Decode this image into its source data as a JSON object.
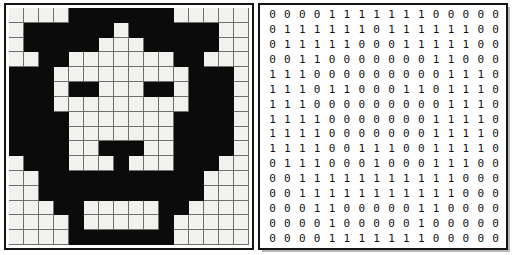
{
  "figure": {
    "panels": [
      {
        "name": "bitmap",
        "role": "rendered black and white pixel image of a face"
      },
      {
        "name": "matrix",
        "role": "binary digit matrix of the same image"
      }
    ],
    "grid_size": {
      "rows": 16,
      "cols": 16
    },
    "legend": {
      "one": "black pixel",
      "zero": "white pixel"
    },
    "colors": {
      "black": "#0b0b0b",
      "white": "#f1f1ee",
      "gridline": "#6f6f6f",
      "border": "#151515",
      "digit_text": "#111111",
      "background": "#ffffff"
    }
  },
  "chart_data": {
    "type": "heatmap",
    "title": "",
    "xlabel": "",
    "ylabel": "",
    "rows": 16,
    "cols": 16,
    "value_labels": {
      "0": "white",
      "1": "black"
    },
    "matrix": [
      [
        0,
        0,
        0,
        0,
        1,
        1,
        1,
        1,
        1,
        1,
        1,
        0,
        0,
        0,
        0,
        0
      ],
      [
        0,
        1,
        1,
        1,
        1,
        1,
        1,
        0,
        1,
        1,
        1,
        1,
        1,
        1,
        0,
        0
      ],
      [
        0,
        1,
        1,
        1,
        1,
        1,
        0,
        0,
        0,
        1,
        1,
        1,
        1,
        1,
        0,
        0
      ],
      [
        0,
        0,
        1,
        1,
        0,
        0,
        0,
        0,
        0,
        0,
        0,
        1,
        1,
        0,
        0,
        0
      ],
      [
        1,
        1,
        1,
        0,
        0,
        0,
        0,
        0,
        0,
        0,
        0,
        0,
        1,
        1,
        1,
        0
      ],
      [
        1,
        1,
        1,
        0,
        1,
        1,
        0,
        0,
        0,
        1,
        1,
        0,
        1,
        1,
        1,
        0
      ],
      [
        1,
        1,
        1,
        0,
        0,
        0,
        0,
        0,
        0,
        0,
        0,
        0,
        1,
        1,
        1,
        0
      ],
      [
        1,
        1,
        1,
        1,
        0,
        0,
        0,
        0,
        0,
        0,
        0,
        1,
        1,
        1,
        1,
        0
      ],
      [
        1,
        1,
        1,
        1,
        0,
        0,
        0,
        0,
        0,
        0,
        0,
        1,
        1,
        1,
        1,
        0
      ],
      [
        1,
        1,
        1,
        1,
        0,
        0,
        1,
        1,
        1,
        0,
        0,
        1,
        1,
        1,
        1,
        0
      ],
      [
        0,
        1,
        1,
        1,
        0,
        0,
        0,
        1,
        0,
        0,
        0,
        1,
        1,
        1,
        0,
        0
      ],
      [
        0,
        0,
        1,
        1,
        1,
        1,
        1,
        1,
        1,
        1,
        1,
        1,
        1,
        0,
        0,
        0
      ],
      [
        0,
        0,
        1,
        1,
        1,
        1,
        1,
        1,
        1,
        1,
        1,
        1,
        1,
        0,
        0,
        0
      ],
      [
        0,
        0,
        0,
        1,
        1,
        0,
        0,
        0,
        0,
        0,
        1,
        1,
        0,
        0,
        0,
        0
      ],
      [
        0,
        0,
        0,
        0,
        1,
        0,
        0,
        0,
        0,
        0,
        1,
        0,
        0,
        0,
        0,
        0
      ],
      [
        0,
        0,
        0,
        0,
        1,
        1,
        1,
        1,
        1,
        1,
        1,
        0,
        0,
        0,
        0,
        0
      ]
    ],
    "row_strings": [
      "0 0 0 0 1 1 1 1 1 1 1 0 0 0 0 0",
      "0 1 1 1 1 1 1 0 1 1 1 1 1 1 0 0",
      "0 1 1 1 1 1 0 0 0 1 1 1 1 1 0 0",
      "0 0 1 1 0 0 0 0 0 0 0 1 1 0 0 0",
      "1 1 1 0 0 0 0 0 0 0 0 0 1 1 1 0",
      "1 1 1 0 1 1 0 0 0 1 1 0 1 1 1 0",
      "1 1 1 0 0 0 0 0 0 0 0 0 1 1 1 0",
      "1 1 1 1 0 0 0 0 0 0 0 1 1 1 1 0",
      "1 1 1 1 0 0 0 0 0 0 0 1 1 1 1 0",
      "1 1 1 1 0 0 1 1 1 0 0 1 1 1 1 0",
      "0 1 1 1 0 0 0 1 0 0 0 1 1 1 0 0",
      "0 0 1 1 1 1 1 1 1 1 1 1 1 0 0 0",
      "0 0 1 1 1 1 1 1 1 1 1 1 1 0 0 0",
      "0 0 0 1 1 0 0 0 0 0 1 1 0 0 0 0",
      "0 0 0 0 1 0 0 0 0 0 1 0 0 0 0 0",
      "0 0 0 0 1 1 1 1 1 1 1 0 0 0 0 0"
    ]
  }
}
